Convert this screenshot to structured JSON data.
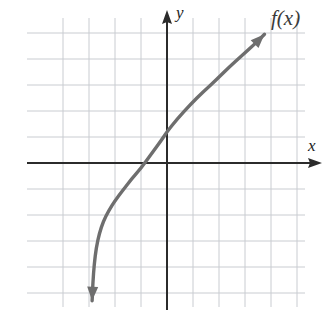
{
  "figure": {
    "kind": "cartesian-graph",
    "width": 333,
    "height": 317,
    "background_color": "#ffffff"
  },
  "labels": {
    "y_axis": "y",
    "x_axis": "x",
    "function": "f(x)"
  },
  "colors": {
    "grid": "#c9ccd1",
    "axis": "#2b2b2b",
    "curve": "#6e6e6e",
    "label": "#1c1c1c"
  },
  "chart_data": {
    "type": "line",
    "title": "",
    "xlabel": "x",
    "ylabel": "y",
    "legend": [
      "f(x)"
    ],
    "legend_position": "top-right",
    "grid": true,
    "grid_spacing_units": 1,
    "xlim": [
      -4.7,
      4.9
    ],
    "ylim": [
      -5.5,
      5.0
    ],
    "origin_px": [
      167,
      163
    ],
    "unit_px": 26,
    "annotations": [
      {
        "text": "f(x)",
        "x": 4.0,
        "y": 4.9
      },
      {
        "text": "y",
        "x": 0.35,
        "y": 5.3
      },
      {
        "text": "x",
        "x": 5.4,
        "y": 0.55
      }
    ],
    "series": [
      {
        "name": "f(x)",
        "arrow_start": true,
        "arrow_end": true,
        "x": [
          -2.88,
          -2.85,
          -2.8,
          -2.72,
          -2.6,
          -2.45,
          -2.25,
          -2.0,
          -1.7,
          -1.35,
          -1.0,
          -0.6,
          -0.2,
          0.0,
          0.4,
          0.9,
          1.4,
          1.9,
          2.4,
          2.9,
          3.4,
          3.75
        ],
        "y": [
          -5.3,
          -4.6,
          -3.9,
          -3.25,
          -2.7,
          -2.25,
          -1.85,
          -1.45,
          -1.05,
          -0.6,
          -0.2,
          0.35,
          0.9,
          1.2,
          1.7,
          2.25,
          2.75,
          3.2,
          3.7,
          4.15,
          4.6,
          4.95
        ]
      }
    ]
  }
}
